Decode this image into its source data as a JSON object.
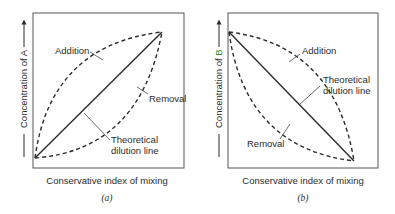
{
  "panels": [
    {
      "id": "a",
      "caption": "(a)",
      "ylabel_prefix": "Concentration of ",
      "ylabel_species": "A",
      "xlabel": "Conservative index of mixing",
      "labels": {
        "addition": "Addition",
        "removal": "Removal",
        "theoretical_1": "Theoretical",
        "theoretical_2": "dilution line"
      },
      "trend": "increasing"
    },
    {
      "id": "b",
      "caption": "(b)",
      "ylabel_prefix": "Concentration of ",
      "ylabel_species": "B",
      "xlabel": "Conservative index of mixing",
      "labels": {
        "addition": "Addition",
        "removal": "Removal",
        "theoretical_1": "Theoretical",
        "theoretical_2": "dilution line"
      },
      "trend": "decreasing"
    }
  ],
  "colors": {
    "line": "#2b2b2b",
    "frame": "#555555",
    "species_highlight": "#3a8a2a"
  }
}
